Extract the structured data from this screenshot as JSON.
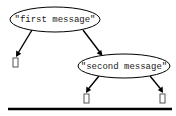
{
  "diagram": {
    "type": "tree",
    "background_color": "#ffffff",
    "stroke_color": "#000000",
    "text_color": "#1a1a1a",
    "nodes": [
      {
        "id": "n1",
        "shape": "ellipse",
        "label": "\"first message\"",
        "cx": 55,
        "cy": 19.5,
        "rx": 45,
        "ry": 12.5
      },
      {
        "id": "n2",
        "shape": "ellipse",
        "label": "\"second message\"",
        "cx": 124,
        "cy": 66,
        "rx": 46,
        "ry": 12
      }
    ],
    "leaves": [
      {
        "id": "l1",
        "shape": "missing-glyph-box",
        "label": "",
        "x": 13,
        "y": 58,
        "w": 5,
        "h": 9
      },
      {
        "id": "l2",
        "shape": "missing-glyph-box",
        "label": "",
        "x": 84,
        "y": 94,
        "w": 5,
        "h": 9
      },
      {
        "id": "l3",
        "shape": "missing-glyph-box",
        "label": "",
        "x": 160,
        "y": 94,
        "w": 5,
        "h": 9
      }
    ],
    "edges": [
      {
        "id": "e1",
        "from": "n1",
        "to": "l1",
        "x1": 32,
        "y1": 30,
        "x2": 16.5,
        "y2": 56
      },
      {
        "id": "e2",
        "from": "n1",
        "to": "n2",
        "x1": 83,
        "y1": 30,
        "x2": 102,
        "y2": 55
      },
      {
        "id": "e3",
        "from": "n2",
        "to": "l2",
        "x1": 99,
        "y1": 76,
        "x2": 86.5,
        "y2": 92
      },
      {
        "id": "e4",
        "from": "n2",
        "to": "l3",
        "x1": 150,
        "y1": 76,
        "x2": 162.5,
        "y2": 92
      }
    ],
    "rule": {
      "x1": 8,
      "y1": 109,
      "x2": 172,
      "y2": 109
    }
  }
}
